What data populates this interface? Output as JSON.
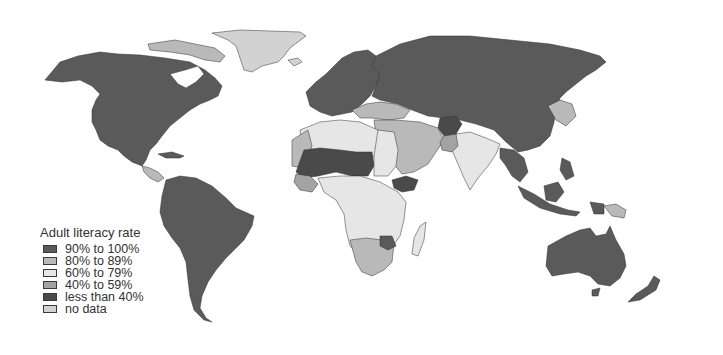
{
  "map": {
    "type": "choropleth world map",
    "projection": "world (Robinson-like)",
    "subject": "Adult literacy rate by country"
  },
  "legend": {
    "title": "Adult literacy rate",
    "items": [
      {
        "label": "90% to 100%",
        "color": "#5a5a5a"
      },
      {
        "label": "80% to 89%",
        "color": "#b9b9b9"
      },
      {
        "label": "60% to 79%",
        "color": "#e6e6e6"
      },
      {
        "label": "40% to 59%",
        "color": "#a3a3a3"
      },
      {
        "label": "less than 40%",
        "color": "#4a4a4a"
      },
      {
        "label": "no data",
        "color": "#d2d2d2"
      }
    ]
  },
  "colors": {
    "background": "#ffffff",
    "border": "#2e2e2e",
    "water": "#ffffff"
  }
}
